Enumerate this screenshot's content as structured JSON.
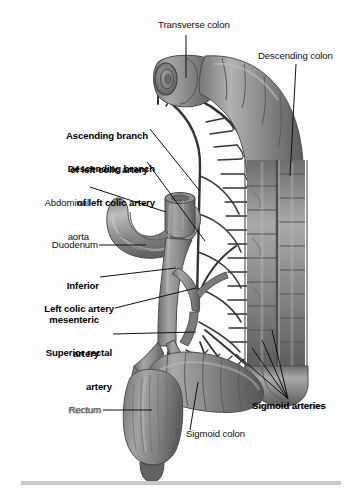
{
  "figure": {
    "width": 361,
    "height": 495,
    "style": "grayscale medical illustration",
    "background_color": "#fdfdfd",
    "ink_color": "#111111",
    "footer_rule_color": "#c9c9c9"
  },
  "labels": [
    {
      "id": "transverse-colon",
      "text": "Transverse colon",
      "bold": false,
      "align": "left",
      "x": 158,
      "y": 24,
      "leader": "vertical line down to cut end of transverse colon"
    },
    {
      "id": "descending-colon",
      "text": "Descending colon",
      "bold": false,
      "align": "left",
      "x": 258,
      "y": 55,
      "leader": "vertical line down to descending colon wall"
    },
    {
      "id": "ascending-branch-left-colic",
      "line1": "Ascending branch",
      "line2": "of left colic artery",
      "bold": true,
      "align": "right",
      "x": 77,
      "y": 113,
      "leader": "diagonal line down-right to ascending branch vessel"
    },
    {
      "id": "descending-branch-left-colic",
      "line1": "Descending branch",
      "line2": "of left colic artery",
      "bold": true,
      "align": "right",
      "x": 70,
      "y": 146,
      "leader": "diagonal line down-right to descending branch vessel"
    },
    {
      "id": "abdominal-aorta",
      "line1": "Abdominal",
      "line2": "aorta",
      "bold": false,
      "align": "right",
      "x": 85,
      "y": 180,
      "leader": "diagonal line right to cut aortic trunk"
    },
    {
      "id": "duodenum",
      "text": "Duodenum",
      "bold": false,
      "align": "right",
      "x": 96,
      "y": 241,
      "leader": "horizontal line right to duodenal C-loop"
    },
    {
      "id": "inferior-mesenteric-artery",
      "line1": "Inferior",
      "line2": "mesenteric",
      "line3": "artery",
      "bold": true,
      "align": "right",
      "x": 97,
      "y": 263,
      "leader": "line right to IMA origin from aorta"
    },
    {
      "id": "left-colic-artery",
      "text": "Left colic artery",
      "bold": true,
      "align": "right",
      "x": 112,
      "y": 308,
      "leader": "diagonal line right to left colic artery trunk"
    },
    {
      "id": "superior-rectal-artery",
      "line1": "Superior rectal",
      "line2": "artery",
      "bold": true,
      "align": "right",
      "x": 110,
      "y": 330,
      "leader": "horizontal line right to superior rectal artery"
    },
    {
      "id": "rectum",
      "text": "Rectum",
      "bold": false,
      "align": "right",
      "x": 100,
      "y": 406,
      "degraded": true,
      "leader": "horizontal line right to rectum"
    },
    {
      "id": "sigmoid-colon",
      "text": "Sigmoid colon",
      "bold": false,
      "align": "left",
      "x": 186,
      "y": 433,
      "leader": "vertical line up to sigmoid colon"
    },
    {
      "id": "sigmoid-arteries",
      "text": "Sigmoid arteries",
      "bold": true,
      "align": "left",
      "x": 252,
      "y": 405,
      "degraded": true,
      "leader": "four leader lines fanning up-left to sigmoid arteries"
    }
  ],
  "anatomy": {
    "structures": [
      "transverse colon (cut end, lumen visible)",
      "descending colon",
      "sigmoid colon",
      "rectum",
      "duodenum (C-loop)",
      "abdominal aorta (cut trunk)",
      "inferior mesenteric artery",
      "left colic artery with ascending and descending branches",
      "sigmoid arteries",
      "superior rectal artery",
      "marginal artery arcade with vasa recta"
    ]
  }
}
